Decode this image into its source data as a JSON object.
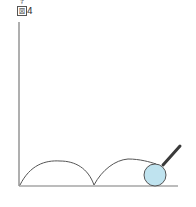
{
  "figure": {
    "label_ruby": "ず",
    "label_kanji": "図",
    "label_number": "4"
  },
  "colors": {
    "axis": "#7a7a7a",
    "curve": "#555555",
    "ball_fill": "#bfe3ef",
    "ball_stroke": "#555555",
    "stick": "#3a3a3a"
  },
  "diagram": {
    "arches": 2
  }
}
